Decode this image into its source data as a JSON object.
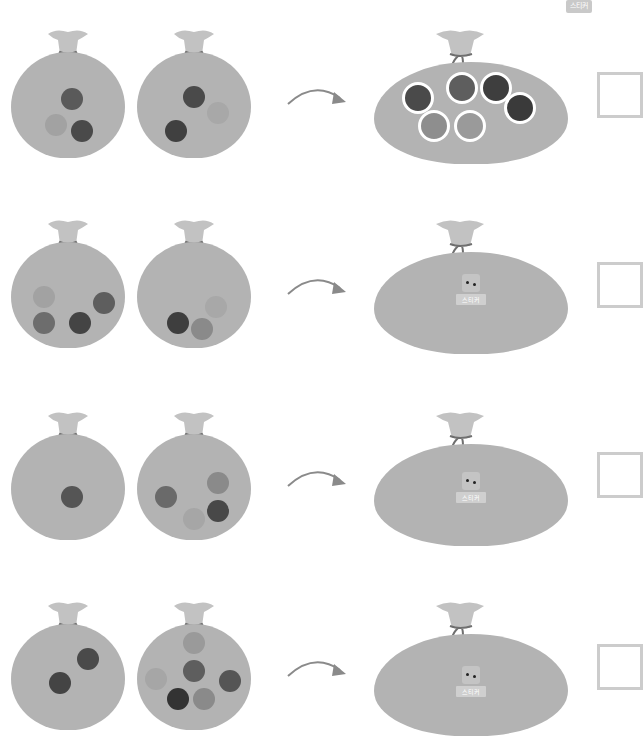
{
  "header": {
    "sticker_badge": "스티커"
  },
  "colors": {
    "bag": "#b3b3b3",
    "bag_neck": "#c2c2c2",
    "tie": "#6f6f6f",
    "coin_dark": "#4a4a4a",
    "coin_mid": "#6d6d6d",
    "coin_light": "#a2a2a2",
    "answer_border": "#cccccc"
  },
  "rows": [
    {
      "left_bag_coins": 3,
      "right_bag_coins": 3,
      "result_coins": 6,
      "result_type": "coins",
      "answer": ""
    },
    {
      "left_bag_coins": 4,
      "right_bag_coins": 3,
      "result_type": "sticker",
      "sticker_label": "스티커",
      "answer": ""
    },
    {
      "left_bag_coins": 1,
      "right_bag_coins": 4,
      "result_type": "sticker",
      "sticker_label": "스티커",
      "answer": ""
    },
    {
      "left_bag_coins": 2,
      "right_bag_coins": 6,
      "result_type": "sticker",
      "sticker_label": "스티커",
      "answer": ""
    }
  ]
}
